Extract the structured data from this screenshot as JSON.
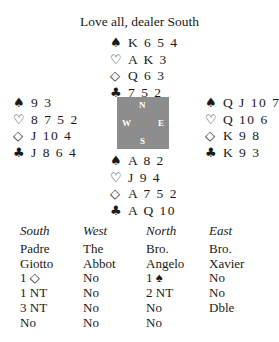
{
  "title": "Love all, dealer South",
  "suit_symbols": {
    "spades": "♠",
    "hearts": "♡",
    "diamonds": "◇",
    "clubs": "♣"
  },
  "hands": {
    "north": {
      "spades": "K 6 5 4",
      "hearts": "A K 3",
      "diamonds": "Q 6 3",
      "clubs": "7 5 2"
    },
    "west": {
      "spades": "9 3",
      "hearts": "8 7 5 2",
      "diamonds": "J 10 4",
      "clubs": "J 8 6 4"
    },
    "east": {
      "spades": "Q J 10 7",
      "hearts": "Q 10 6",
      "diamonds": "K 9 8",
      "clubs": "K 9 3"
    },
    "south": {
      "spades": "A 8 2",
      "hearts": "J 9 4",
      "diamonds": "A 7 5 2",
      "clubs": "A Q 10"
    }
  },
  "compass": {
    "n": "N",
    "s": "S",
    "w": "W",
    "e": "E",
    "color": "#8d8d8d"
  },
  "auction": {
    "headers": [
      "South",
      "West",
      "North",
      "East"
    ],
    "rows": [
      [
        "Padre",
        "The",
        "Bro.",
        "Bro."
      ],
      [
        "Giotto",
        "Abbot",
        "Angelo",
        "Xavier"
      ],
      [
        "1 ◇",
        "No",
        "1 ♠",
        "No"
      ],
      [
        "1 NT",
        "No",
        "2 NT",
        "No"
      ],
      [
        "3 NT",
        "No",
        "No",
        "Dble"
      ],
      [
        "No",
        "No",
        "No",
        ""
      ]
    ]
  }
}
